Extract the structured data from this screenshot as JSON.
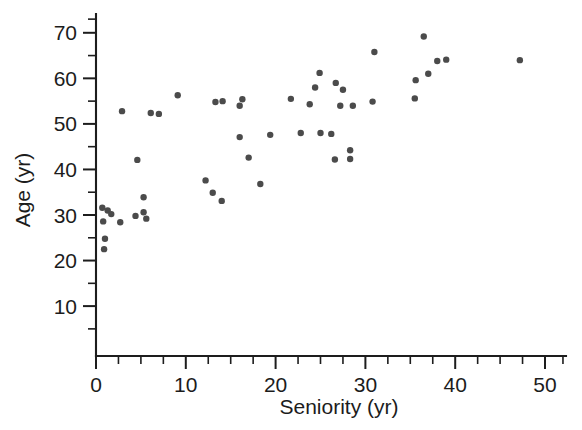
{
  "chart_data": {
    "type": "scatter",
    "title": "",
    "xlabel": "Seniority (yr)",
    "ylabel": "Age (yr)",
    "xlim": [
      -1.5,
      52.5
    ],
    "ylim": [
      3,
      74
    ],
    "grid": false,
    "legend": "none",
    "marker_color": "#4b4b4b",
    "marker_size_px": 6.4,
    "x_ticks_major": [
      0,
      10,
      20,
      30,
      40,
      50
    ],
    "x_tick_labels": [
      "0",
      "10",
      "20",
      "30",
      "40",
      "50"
    ],
    "x_ticks_minor": [
      2.5,
      5,
      7.5,
      12.5,
      15,
      17.5,
      22.5,
      25,
      27.5,
      32.5,
      35,
      37.5,
      42.5,
      45,
      47.5,
      52
    ],
    "y_ticks_major": [
      10,
      20,
      30,
      40,
      50,
      60,
      70
    ],
    "y_tick_labels": [
      "10",
      "20",
      "30",
      "40",
      "50",
      "60",
      "70"
    ],
    "y_ticks_minor": [
      5,
      15,
      25,
      35,
      45,
      55,
      65,
      73
    ],
    "points": [
      {
        "x": 0.7,
        "y": 31.6
      },
      {
        "x": 0.8,
        "y": 28.6
      },
      {
        "x": 0.9,
        "y": 22.5
      },
      {
        "x": 1.0,
        "y": 24.8
      },
      {
        "x": 1.3,
        "y": 31.0
      },
      {
        "x": 1.7,
        "y": 30.2
      },
      {
        "x": 2.7,
        "y": 28.4
      },
      {
        "x": 2.9,
        "y": 52.8
      },
      {
        "x": 4.4,
        "y": 29.8
      },
      {
        "x": 4.6,
        "y": 42.1
      },
      {
        "x": 5.3,
        "y": 33.9
      },
      {
        "x": 5.3,
        "y": 30.6
      },
      {
        "x": 5.6,
        "y": 29.2
      },
      {
        "x": 6.1,
        "y": 52.4
      },
      {
        "x": 7.0,
        "y": 52.2
      },
      {
        "x": 9.1,
        "y": 56.3
      },
      {
        "x": 12.2,
        "y": 37.6
      },
      {
        "x": 13.0,
        "y": 34.9
      },
      {
        "x": 13.3,
        "y": 54.8
      },
      {
        "x": 14.0,
        "y": 33.1
      },
      {
        "x": 14.1,
        "y": 55.0
      },
      {
        "x": 16.0,
        "y": 54.0
      },
      {
        "x": 16.3,
        "y": 55.4
      },
      {
        "x": 16.0,
        "y": 47.1
      },
      {
        "x": 17.0,
        "y": 42.6
      },
      {
        "x": 18.3,
        "y": 36.8
      },
      {
        "x": 19.4,
        "y": 47.6
      },
      {
        "x": 21.7,
        "y": 55.5
      },
      {
        "x": 22.8,
        "y": 48.0
      },
      {
        "x": 23.8,
        "y": 54.3
      },
      {
        "x": 24.4,
        "y": 58.0
      },
      {
        "x": 24.9,
        "y": 61.2
      },
      {
        "x": 25.0,
        "y": 48.0
      },
      {
        "x": 26.2,
        "y": 47.8
      },
      {
        "x": 26.7,
        "y": 59.0
      },
      {
        "x": 27.5,
        "y": 57.5
      },
      {
        "x": 27.2,
        "y": 54.0
      },
      {
        "x": 28.3,
        "y": 44.2
      },
      {
        "x": 28.3,
        "y": 42.3
      },
      {
        "x": 28.6,
        "y": 54.0
      },
      {
        "x": 26.6,
        "y": 42.2
      },
      {
        "x": 30.8,
        "y": 54.9
      },
      {
        "x": 31.0,
        "y": 65.8
      },
      {
        "x": 35.5,
        "y": 55.6
      },
      {
        "x": 35.6,
        "y": 59.6
      },
      {
        "x": 36.5,
        "y": 69.2
      },
      {
        "x": 37.0,
        "y": 61.0
      },
      {
        "x": 38.0,
        "y": 63.8
      },
      {
        "x": 39.0,
        "y": 64.1
      },
      {
        "x": 47.2,
        "y": 64.0
      }
    ]
  },
  "axes": {
    "x_title": "Seniority (yr)",
    "y_title": "Age (yr)"
  }
}
